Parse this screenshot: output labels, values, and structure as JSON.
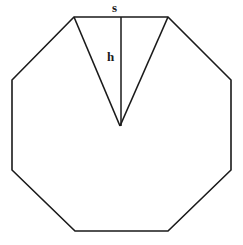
{
  "figure": {
    "kind": "geometry-diagram",
    "shape_name": "regular octagon",
    "background_color": "#ffffff",
    "stroke_color": "#1a1a1a",
    "stroke_width": 1.6,
    "fill": "none",
    "canvas": {
      "width": 243,
      "height": 245
    },
    "octagon": {
      "sides": 8,
      "vertices": [
        {
          "x": 74,
          "y": 17
        },
        {
          "x": 168,
          "y": 17
        },
        {
          "x": 231,
          "y": 80
        },
        {
          "x": 231,
          "y": 170
        },
        {
          "x": 168,
          "y": 231
        },
        {
          "x": 75,
          "y": 231
        },
        {
          "x": 12,
          "y": 170
        },
        {
          "x": 12,
          "y": 80
        }
      ],
      "points_attr": "74,17 168,17 231,80 231,170 168,231 75,231 12,170 12,80"
    },
    "triangle": {
      "description": "isosceles triangle from top side to center",
      "vertices": [
        {
          "x": 74,
          "y": 17
        },
        {
          "x": 168,
          "y": 17
        },
        {
          "x": 120,
          "y": 126
        }
      ],
      "left_edge": {
        "x1": 74,
        "y1": 17,
        "x2": 120,
        "y2": 126
      },
      "right_edge": {
        "x1": 168,
        "y1": 17,
        "x2": 120,
        "y2": 126
      }
    },
    "height_line": {
      "description": "apothem / triangle height from top side to center",
      "x1": 121,
      "y1": 17,
      "x2": 121,
      "y2": 126
    },
    "labels": {
      "side": "s",
      "height": "h"
    }
  }
}
